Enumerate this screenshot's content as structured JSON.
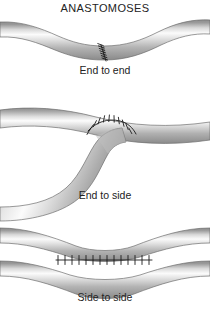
{
  "figure": {
    "title": "ANASTOMOSES",
    "background_color": "#ffffff",
    "ink_color": "#232323",
    "vessel_edge_color": "#6e6e6e",
    "vessel_dark_color": "#8a8a8a",
    "vessel_highlight_color": "#fdfdfd",
    "suture_color": "#1b1b1b",
    "panels": [
      {
        "label": "End to end",
        "type": "end-to-end",
        "description": "Two tubular vessels joined end to end along a single oblique suture line at the narrow waist",
        "suture_count": 7,
        "suture_orientation": "oblique-vertical"
      },
      {
        "label": "End to side",
        "type": "end-to-side",
        "description": "A curved vessel sweeps up from lower left and is sutured onto the side wall of a horizontal vessel",
        "suture_count": 9,
        "suture_orientation": "arc-over-dome"
      },
      {
        "label": "Side to side",
        "type": "side-to-side",
        "description": "Two parallel vessels tapering toward the midline joined along a horizontal suture line",
        "suture_count": 14,
        "suture_orientation": "vertical-row"
      }
    ]
  }
}
